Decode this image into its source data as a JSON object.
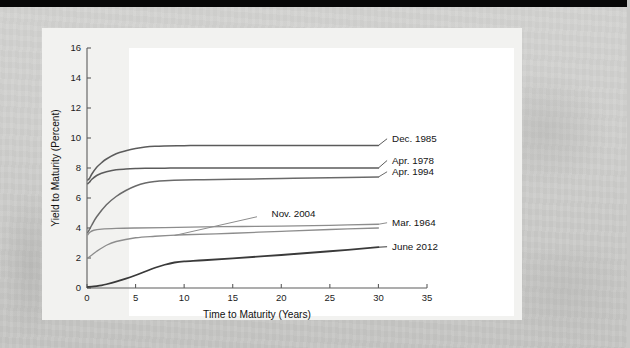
{
  "figure": {
    "background_color": "#f2f2f0",
    "plot_background_color": "#ffffff",
    "page_background_color": "#cfcfcd",
    "top_band_color": "#070707"
  },
  "chart_data": {
    "type": "line",
    "title": "",
    "xlabel": "Time to Maturity (Years)",
    "ylabel": "Yield to Maturity (Percent)",
    "xlim": [
      0,
      35
    ],
    "ylim": [
      0,
      16
    ],
    "xticks": [
      0,
      5,
      10,
      15,
      20,
      25,
      30,
      35
    ],
    "xtick_labels": [
      "0",
      "5",
      "10",
      "15",
      "20",
      "25",
      "30",
      "35"
    ],
    "yticks": [
      0,
      2,
      4,
      6,
      8,
      10,
      12,
      14,
      16
    ],
    "ytick_labels": [
      "0",
      "2",
      "4",
      "6",
      "8",
      "10",
      "12",
      "14",
      "16"
    ],
    "grid": false,
    "legend": "inline-right-labels",
    "series": [
      {
        "name": "Dec. 1985",
        "color": "#5b5b5b",
        "width": 1.5,
        "label_x": 31.2,
        "label_y": 9.95,
        "x": [
          0.08,
          0.25,
          0.5,
          1,
          1.5,
          2,
          3,
          4,
          5,
          6,
          7,
          8,
          10,
          12,
          15,
          20,
          25,
          30
        ],
        "y": [
          7.2,
          7.3,
          7.6,
          8.05,
          8.35,
          8.6,
          8.95,
          9.15,
          9.3,
          9.4,
          9.45,
          9.47,
          9.49,
          9.5,
          9.5,
          9.5,
          9.5,
          9.5
        ]
      },
      {
        "name": "Apr. 1978",
        "color": "#5b5b5b",
        "width": 1.5,
        "label_x": 31.2,
        "label_y": 8.5,
        "x": [
          0.08,
          0.25,
          0.5,
          1,
          1.5,
          2,
          3,
          4,
          5,
          6,
          8,
          10,
          15,
          20,
          25,
          30
        ],
        "y": [
          6.95,
          7.05,
          7.25,
          7.5,
          7.65,
          7.75,
          7.88,
          7.93,
          7.96,
          7.98,
          7.99,
          8.0,
          8.0,
          8.0,
          8.0,
          8.0
        ]
      },
      {
        "name": "Apr. 1994",
        "color": "#6a6a6a",
        "width": 1.5,
        "label_x": 31.2,
        "label_y": 7.75,
        "x": [
          0.08,
          0.25,
          0.5,
          1,
          2,
          3,
          4,
          5,
          6,
          7,
          8,
          10,
          12,
          15,
          20,
          25,
          30
        ],
        "y": [
          3.7,
          3.9,
          4.2,
          4.75,
          5.55,
          6.1,
          6.5,
          6.8,
          7.0,
          7.1,
          7.15,
          7.2,
          7.22,
          7.25,
          7.3,
          7.35,
          7.4
        ]
      },
      {
        "name": "Nov. 2004",
        "color": "#8d8d8d",
        "width": 1.3,
        "label_x": 19.0,
        "label_y": 4.95,
        "leader_from_x": 17.5,
        "leader_from_y": 4.75,
        "leader_to_x": 9.0,
        "leader_to_y": 3.5,
        "x": [
          0.08,
          0.5,
          1,
          2,
          3,
          5,
          7,
          10,
          15,
          20,
          25,
          30
        ],
        "y": [
          2.0,
          2.2,
          2.45,
          2.85,
          3.1,
          3.35,
          3.45,
          3.55,
          3.65,
          3.78,
          3.9,
          4.0
        ]
      },
      {
        "name": "Mar. 1964",
        "color": "#8d8d8d",
        "width": 1.3,
        "label_x": 31.2,
        "label_y": 4.35,
        "x": [
          0.08,
          0.3,
          0.7,
          1.5,
          3,
          5,
          8,
          12,
          16,
          20,
          25,
          30
        ],
        "y": [
          3.55,
          3.72,
          3.85,
          3.92,
          3.97,
          4.0,
          4.03,
          4.07,
          4.1,
          4.13,
          4.18,
          4.25
        ]
      },
      {
        "name": "June 2012",
        "color": "#3a3a3a",
        "width": 1.8,
        "label_x": 31.2,
        "label_y": 2.75,
        "x": [
          0.08,
          0.5,
          1,
          1.5,
          2,
          3,
          4,
          5,
          6,
          7,
          8,
          9,
          10,
          12,
          15,
          20,
          25,
          30
        ],
        "y": [
          0.07,
          0.09,
          0.13,
          0.18,
          0.25,
          0.42,
          0.62,
          0.85,
          1.1,
          1.35,
          1.55,
          1.7,
          1.78,
          1.85,
          1.98,
          2.2,
          2.45,
          2.72
        ]
      }
    ]
  }
}
